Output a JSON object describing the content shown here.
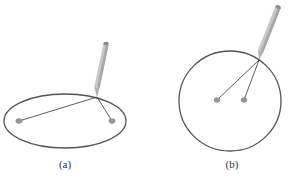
{
  "figures": [
    {
      "id": "a",
      "label": "(a)",
      "shape": "ellipse",
      "curve": {
        "cx": 65,
        "cy": 121,
        "rx": 61,
        "ry": 27
      },
      "pins": [
        {
          "x": 19,
          "y": 121
        },
        {
          "x": 112,
          "y": 121
        }
      ],
      "pencil_tip": {
        "x": 97,
        "y": 97
      },
      "pencil_end": {
        "x": 106,
        "y": 42
      },
      "label_pos": {
        "x": 65,
        "y": 168
      }
    },
    {
      "id": "b",
      "label": "(b)",
      "shape": "circle",
      "curve": {
        "cx": 230,
        "cy": 101,
        "rx": 51,
        "ry": 50
      },
      "pins": [
        {
          "x": 217,
          "y": 100
        },
        {
          "x": 244,
          "y": 100
        }
      ],
      "pencil_tip": {
        "x": 259,
        "y": 60
      },
      "pencil_end": {
        "x": 278,
        "y": 7
      },
      "label_pos": {
        "x": 232,
        "y": 168
      }
    }
  ],
  "colors": {
    "curve": "#555555",
    "string": "#333333",
    "pin": "#999999",
    "pencil_body": "#c8c8c8",
    "pencil_shade": "#a8a8a8",
    "pencil_cap": "#8a8a8a",
    "label": "#333333"
  }
}
